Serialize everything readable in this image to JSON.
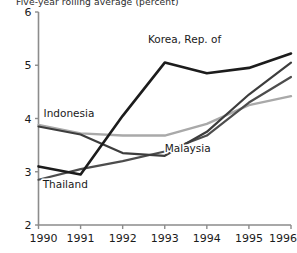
{
  "chart_data": {
    "type": "line",
    "title": "Five-year rolling average (percent)",
    "xlabel": "",
    "ylabel": "",
    "x": [
      1990,
      1991,
      1992,
      1993,
      1994,
      1995,
      1996
    ],
    "xtick_labels": [
      "1990",
      "1991",
      "1992",
      "1993",
      "1994",
      "1995",
      "1996"
    ],
    "ytick_labels": [
      "2",
      "3",
      "4",
      "5",
      "6"
    ],
    "yticks": [
      2,
      3,
      4,
      5,
      6
    ],
    "ylim": [
      2,
      6
    ],
    "xlim": [
      1990,
      1996
    ],
    "grid": false,
    "legend_position": "inline-annotations",
    "series": [
      {
        "name": "Korea, Rep. of",
        "color": "#1c1c1c",
        "width": 2.6,
        "values": [
          3.1,
          2.95,
          4.05,
          5.05,
          4.85,
          4.95,
          5.22
        ],
        "label_x": 1992.6,
        "label_y": 5.42
      },
      {
        "name": "Indonesia",
        "color": "#3d3d3d",
        "width": 2.2,
        "values": [
          3.85,
          3.7,
          3.35,
          3.3,
          3.75,
          4.45,
          5.05
        ],
        "label_x": 1990.12,
        "label_y": 4.02
      },
      {
        "name": "Malaysia",
        "color": "#a9a9a9",
        "width": 2.4,
        "values": [
          3.88,
          3.72,
          3.68,
          3.68,
          3.9,
          4.25,
          4.42
        ],
        "label_x": 1993.0,
        "label_y": 3.38
      },
      {
        "name": "Thailand",
        "color": "#4d4d4d",
        "width": 2.2,
        "values": [
          2.85,
          3.05,
          3.2,
          3.38,
          3.68,
          4.3,
          4.78
        ],
        "label_x": 1990.1,
        "label_y": 2.7
      }
    ]
  }
}
